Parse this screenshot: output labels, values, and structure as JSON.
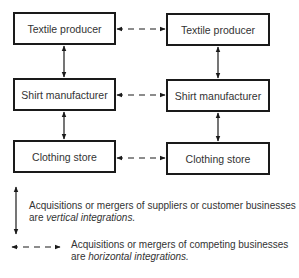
{
  "diagram": {
    "left_column": [
      {
        "label": "Textile producer"
      },
      {
        "label": "Shirt manufacturer"
      },
      {
        "label": "Clothing store"
      }
    ],
    "right_column": [
      {
        "label": "Textile producer"
      },
      {
        "label": "Shirt manufacturer"
      },
      {
        "label": "Clothing store"
      }
    ],
    "connections": {
      "vertical": "solid double-headed arrows between stacked boxes",
      "horizontal": "dashed double-headed arrows between paired boxes"
    }
  },
  "legend": {
    "vertical": {
      "line1": "Acquisitions or mergers of suppliers or customer businesses",
      "line2_prefix": "are ",
      "line2_term": "vertical integrations."
    },
    "horizontal": {
      "line1": "Acquisitions or mergers of competing businesses",
      "line2_prefix": "are ",
      "line2_term": "horizontal integrations."
    }
  },
  "colors": {
    "line": "#1a1a1a",
    "text": "#333333",
    "background": "#ffffff"
  }
}
